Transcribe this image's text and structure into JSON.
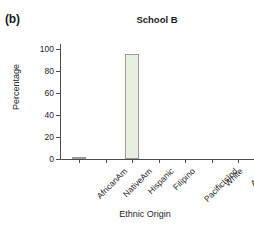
{
  "panel": {
    "label": "(b)"
  },
  "chart_data": {
    "type": "bar",
    "title": "School B",
    "xlabel": "Ethnic Origin",
    "ylabel": "Percentage",
    "categories": [
      "AfricanAm",
      "NativeAm",
      "Hispanic",
      "Filipino",
      "PacificIsInd",
      "White",
      "Asian"
    ],
    "values": [
      1,
      0,
      96,
      0,
      0,
      0,
      0
    ],
    "ylim": [
      0,
      105
    ],
    "yticks": [
      0,
      20,
      40,
      60,
      80,
      100
    ],
    "ytick_labels": [
      "0",
      "20",
      "40",
      "60",
      "80",
      "100"
    ],
    "grid": false,
    "legend": false,
    "bar_fill": "#e8eee0",
    "bar_edge": "#9a9a9a",
    "axis_color": "#4d4d4d"
  }
}
